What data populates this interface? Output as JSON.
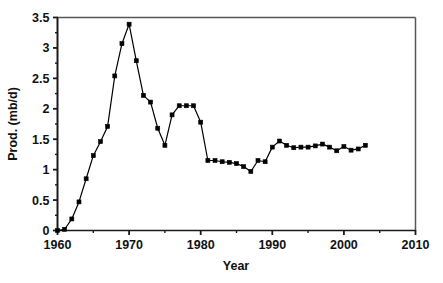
{
  "chart_data": {
    "type": "line",
    "title": "",
    "xlabel": "Year",
    "ylabel": "Prod. (mb/d)",
    "xlim": [
      1960,
      2010
    ],
    "ylim": [
      0,
      3.5
    ],
    "grid": false,
    "legend": null,
    "marker": "square",
    "line_color": "#000000",
    "marker_color": "#000000",
    "background_color": "#ffffff",
    "x_ticks": [
      1960,
      1970,
      1980,
      1990,
      2000,
      2010
    ],
    "x_tick_labels": [
      "1960",
      "1970",
      "1980",
      "1990",
      "2000",
      "2010"
    ],
    "x_minor_ticks": [
      1965,
      1975,
      1985,
      1995,
      2005
    ],
    "y_ticks": [
      0,
      0.5,
      1,
      1.5,
      2,
      2.5,
      3,
      3.5
    ],
    "y_tick_labels": [
      "0",
      "0.5",
      "1",
      "1.5",
      "2",
      "2.5",
      "3",
      "3.5"
    ],
    "y_minor_ticks": [
      0.25,
      0.75,
      1.25,
      1.75,
      2.25,
      2.75,
      3.25
    ],
    "series": [
      {
        "name": "Production",
        "x": [
          1960,
          1961,
          1962,
          1963,
          1964,
          1965,
          1966,
          1967,
          1968,
          1969,
          1970,
          1971,
          1972,
          1973,
          1974,
          1975,
          1976,
          1977,
          1978,
          1979,
          1980,
          1981,
          1982,
          1983,
          1984,
          1985,
          1986,
          1987,
          1988,
          1989,
          1990,
          1991,
          1992,
          1993,
          1994,
          1995,
          1996,
          1997,
          1998,
          1999,
          2000,
          2001,
          2002,
          2003
        ],
        "values": [
          0.0,
          0.02,
          0.19,
          0.47,
          0.85,
          1.23,
          1.46,
          1.71,
          2.54,
          3.07,
          3.39,
          2.79,
          2.22,
          2.11,
          1.68,
          1.4,
          1.9,
          2.05,
          2.05,
          2.05,
          1.78,
          1.15,
          1.15,
          1.13,
          1.12,
          1.1,
          1.05,
          0.97,
          1.15,
          1.13,
          1.37,
          1.47,
          1.4,
          1.36,
          1.37,
          1.37,
          1.39,
          1.42,
          1.37,
          1.31,
          1.38,
          1.32,
          1.34,
          1.4
        ]
      }
    ]
  },
  "axes": {
    "y_axis_title": "Prod. (mb/d)",
    "x_axis_title": "Year"
  }
}
